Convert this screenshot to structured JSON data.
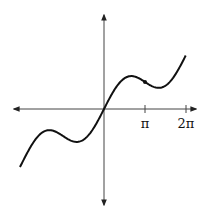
{
  "chart_data": {
    "type": "line",
    "title": "",
    "function": "y = x + 2 sin(x)",
    "xlabel": "",
    "ylabel": "",
    "x_tick_labels": [
      "π",
      "2π"
    ],
    "x_ticks": [
      3.14159,
      6.28319
    ],
    "xlim": [
      -8.0,
      7.0
    ],
    "ylim": [
      -11.0,
      11.0
    ],
    "grid": false,
    "legend": null,
    "series": [
      {
        "name": "f(x)",
        "color": "#111111",
        "x": [
          -6.44,
          -5.5,
          -4.19,
          -3.14,
          -2.09,
          -1.0,
          0,
          1.0,
          2.09,
          3.14,
          4.19,
          5.5,
          6.28
        ],
        "y": [
          -6.75,
          -3.99,
          -2.46,
          -3.14,
          -3.82,
          -2.68,
          0,
          2.68,
          3.82,
          3.14,
          2.46,
          3.99,
          6.28
        ]
      }
    ],
    "marked_point": {
      "x": 3.14159,
      "y": 3.14159
    }
  },
  "labels": {
    "pi": "π",
    "two_pi": "2π"
  },
  "colors": {
    "axis": "#333333",
    "curve": "#111111"
  }
}
